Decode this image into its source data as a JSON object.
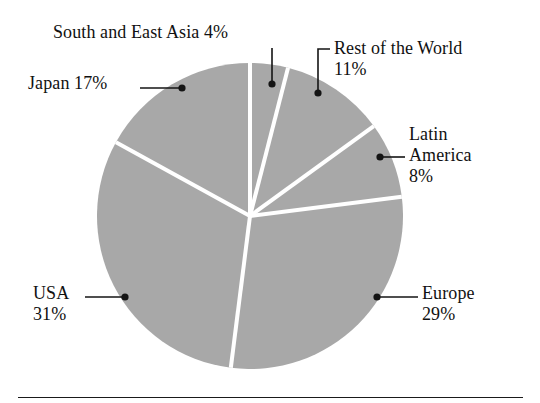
{
  "figure": {
    "background_color": "#ffffff",
    "slice_fill_color": "#a8a8a8",
    "slice_separator_color": "#ffffff",
    "leader_color": "#141414",
    "rule_color": "#1a1a1a"
  },
  "labels": {
    "south_east_asia": "South and East Asia 4%",
    "rest_of_world_name": "Rest of the World",
    "rest_of_world_pct": "11%",
    "japan": "Japan 17%",
    "latin_america_line1": "Latin",
    "latin_america_line2": "America",
    "latin_america_pct": "8%",
    "usa_name": "USA",
    "usa_pct": "31%",
    "europe_name": "Europe",
    "europe_pct": "29%"
  },
  "chart_data": {
    "type": "pie",
    "title": "",
    "subtitle": "",
    "xlabel": "",
    "ylabel": "",
    "grid": false,
    "legend_position": "none",
    "labels_style": "leader-lines-with-dots",
    "start_angle_deg": 90,
    "direction": "clockwise",
    "center_px": [
      250,
      216
    ],
    "radius_px": 153,
    "categories": [
      "South and East Asia",
      "Rest of the World",
      "Latin America",
      "Europe",
      "USA",
      "Japan"
    ],
    "values": [
      4,
      11,
      8,
      29,
      31,
      17
    ],
    "value_labels": [
      "4%",
      "11%",
      "8%",
      "29%",
      "31%",
      "17%"
    ],
    "units": "percent",
    "total": 100,
    "colors": [
      "#a8a8a8",
      "#a8a8a8",
      "#a8a8a8",
      "#a8a8a8",
      "#a8a8a8",
      "#a8a8a8"
    ]
  }
}
